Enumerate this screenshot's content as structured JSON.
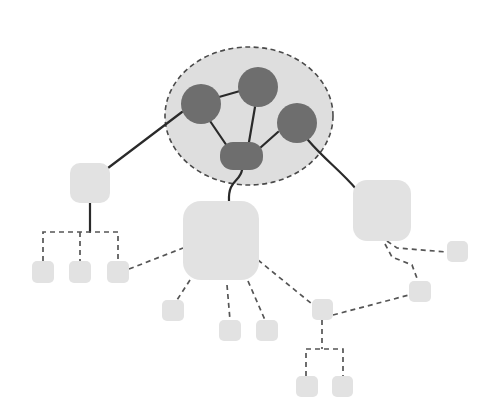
{
  "diagram": {
    "type": "network-topology",
    "width": 487,
    "height": 418,
    "colors": {
      "background": "#ffffff",
      "cluster_fill": "#dedede",
      "cluster_stroke": "#4a4a4a",
      "core_node_fill": "#6e6e6e",
      "node_fill": "#e2e2e2",
      "solid_edge": "#2a2a2a",
      "dashed_edge": "#555555"
    },
    "cluster": {
      "id": "core-cluster",
      "cx": 249,
      "cy": 116,
      "rx": 84,
      "ry": 69
    },
    "core_nodes": [
      {
        "id": "core-a",
        "shape": "circle",
        "cx": 201,
        "cy": 104,
        "r": 20
      },
      {
        "id": "core-b",
        "shape": "circle",
        "cx": 258,
        "cy": 87,
        "r": 20
      },
      {
        "id": "core-c",
        "shape": "circle",
        "cx": 297,
        "cy": 123,
        "r": 20
      },
      {
        "id": "core-hub",
        "shape": "pill",
        "x": 220,
        "y": 142,
        "w": 43,
        "h": 28,
        "rx": 13
      }
    ],
    "nodes": [
      {
        "id": "left-mid",
        "x": 70,
        "y": 163,
        "w": 40,
        "h": 40,
        "rx": 10
      },
      {
        "id": "center-big",
        "x": 183,
        "y": 201,
        "w": 76,
        "h": 79,
        "rx": 18
      },
      {
        "id": "right-big",
        "x": 353,
        "y": 180,
        "w": 58,
        "h": 61,
        "rx": 14
      },
      {
        "id": "leaf-l1",
        "x": 32,
        "y": 261,
        "w": 22,
        "h": 22,
        "rx": 5
      },
      {
        "id": "leaf-l2",
        "x": 69,
        "y": 261,
        "w": 22,
        "h": 22,
        "rx": 5
      },
      {
        "id": "leaf-l3",
        "x": 107,
        "y": 261,
        "w": 22,
        "h": 22,
        "rx": 5
      },
      {
        "id": "leaf-c1",
        "x": 162,
        "y": 300,
        "w": 22,
        "h": 21,
        "rx": 5
      },
      {
        "id": "leaf-c2",
        "x": 219,
        "y": 320,
        "w": 22,
        "h": 21,
        "rx": 5
      },
      {
        "id": "leaf-c3",
        "x": 256,
        "y": 320,
        "w": 22,
        "h": 21,
        "rx": 5
      },
      {
        "id": "relay",
        "x": 312,
        "y": 299,
        "w": 21,
        "h": 21,
        "rx": 5
      },
      {
        "id": "leaf-b1",
        "x": 296,
        "y": 376,
        "w": 22,
        "h": 21,
        "rx": 5
      },
      {
        "id": "leaf-b2",
        "x": 332,
        "y": 376,
        "w": 21,
        "h": 21,
        "rx": 5
      },
      {
        "id": "leaf-r1",
        "x": 447,
        "y": 241,
        "w": 21,
        "h": 21,
        "rx": 5
      },
      {
        "id": "leaf-r2",
        "x": 409,
        "y": 281,
        "w": 22,
        "h": 21,
        "rx": 5
      }
    ],
    "solid_edges": [
      {
        "id": "a-b",
        "d": "M219,97 L240,91"
      },
      {
        "id": "a-hub",
        "d": "M210,121 L227,146"
      },
      {
        "id": "b-hub",
        "d": "M255,107 L249,142"
      },
      {
        "id": "c-hub",
        "d": "M278,132 L260,148"
      },
      {
        "id": "a-leftmid",
        "d": "M182,112 L108,168"
      },
      {
        "id": "hub-centerbig",
        "d": "M242,170 C240,182 228,180 229,201"
      },
      {
        "id": "c-rightbig",
        "d": "M308,140 C325,160 340,170 357,190"
      },
      {
        "id": "leftmid-bracket",
        "d": "M90,203 L90,232"
      }
    ],
    "dashed_edges": [
      {
        "id": "bracket-left",
        "d": "M43,261 L43,232 L118,232 L118,261"
      },
      {
        "id": "bracket-left-mid",
        "d": "M80,232 L80,261"
      },
      {
        "id": "leafl3-centerbig",
        "d": "M129,269 L183,248"
      },
      {
        "id": "centerbig-c1",
        "d": "M190,280 L177,300"
      },
      {
        "id": "centerbig-c2",
        "d": "M227,285 L230,320"
      },
      {
        "id": "centerbig-c3",
        "d": "M248,281 L265,320"
      },
      {
        "id": "centerbig-relay",
        "d": "M258,260 L312,304"
      },
      {
        "id": "relay-leafr2",
        "d": "M333,315 L409,295"
      },
      {
        "id": "rightbig-leafr1",
        "d": "M387,241 L397,248 L447,252"
      },
      {
        "id": "rightbig-leafr2",
        "d": "M385,244 L392,257 L412,265 L418,281"
      },
      {
        "id": "relay-bracket",
        "d": "M322,320 L322,349"
      },
      {
        "id": "bracket-bottom",
        "d": "M306,376 L306,349 L343,349 L343,376"
      }
    ]
  }
}
